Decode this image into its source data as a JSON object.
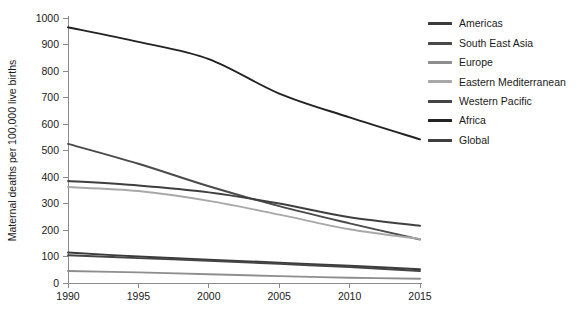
{
  "chart_data": {
    "type": "line",
    "title": "",
    "xlabel": "",
    "ylabel": "Maternal deaths per 100,000 live births",
    "x": [
      1990,
      1995,
      2000,
      2005,
      2010,
      2015
    ],
    "xlim": [
      1990,
      2015
    ],
    "ylim": [
      0,
      1000
    ],
    "xticks": [
      "1990",
      "1995",
      "2000",
      "2005",
      "2010",
      "2015"
    ],
    "yticks": [
      "0",
      "100",
      "200",
      "300",
      "400",
      "500",
      "600",
      "700",
      "800",
      "900",
      "1000"
    ],
    "grid": false,
    "legend_position": "right",
    "series": [
      {
        "name": "Americas",
        "color": "#3b3b3b",
        "values": [
          115,
          100,
          88,
          77,
          65,
          52
        ]
      },
      {
        "name": "South East Asia",
        "color": "#4a4a4a",
        "values": [
          525,
          450,
          365,
          290,
          225,
          164
        ]
      },
      {
        "name": "Europe",
        "color": "#8e8e8e",
        "values": [
          45,
          40,
          33,
          26,
          20,
          16
        ]
      },
      {
        "name": "Eastern Mediterranean",
        "color": "#a8a8a8",
        "values": [
          362,
          347,
          310,
          258,
          203,
          166
        ]
      },
      {
        "name": "Western Pacific",
        "color": "#444444",
        "values": [
          105,
          94,
          84,
          72,
          60,
          45
        ]
      },
      {
        "name": "Africa",
        "color": "#222222",
        "values": [
          965,
          910,
          845,
          715,
          625,
          542
        ]
      },
      {
        "name": "Global",
        "color": "#3f3f3f",
        "values": [
          385,
          368,
          342,
          300,
          248,
          216
        ]
      }
    ]
  }
}
